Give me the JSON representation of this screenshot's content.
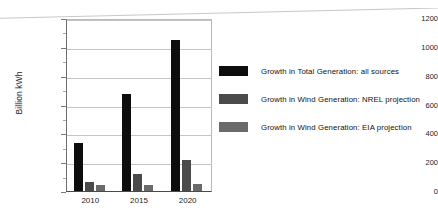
{
  "chart_data": {
    "type": "bar",
    "title": "",
    "xlabel": "",
    "ylabel": "Billion kWh",
    "categories": [
      "2010",
      "2015",
      "2020"
    ],
    "ylim": [
      0,
      1200
    ],
    "yticks": [
      0,
      200,
      400,
      600,
      800,
      1000,
      1200
    ],
    "ytick_labels": [
      "0",
      "200",
      "400",
      "600",
      "800",
      "1000",
      "1200"
    ],
    "grid": true,
    "legend_position": "right",
    "series": [
      {
        "name": "Growth in Total Generation: all sources",
        "color": "#0d0d0d",
        "values": [
          330,
          670,
          1050
        ]
      },
      {
        "name": "Growth in Wind Generation: NREL projection",
        "color": "#4b4b4b",
        "values": [
          60,
          120,
          215
        ]
      },
      {
        "name": "Growth in Wind Generation: EIA projection",
        "color": "#6a6a6a",
        "values": [
          40,
          45,
          50
        ]
      }
    ]
  }
}
